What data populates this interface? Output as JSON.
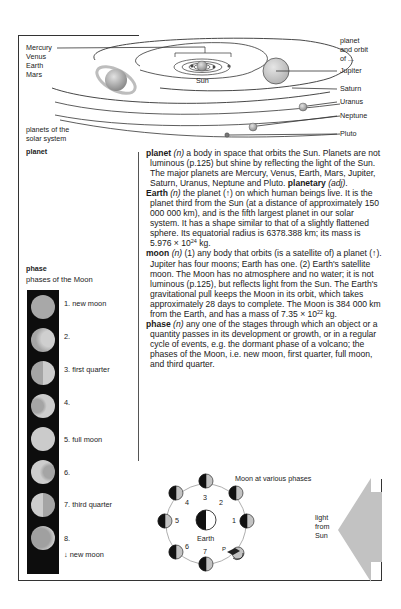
{
  "solar_diagram": {
    "inner_planets": [
      "Mercury",
      "Venus",
      "Earth",
      "Mars"
    ],
    "sun_label": "Sun",
    "caption_right": "planet and orbit of ...",
    "caption_right_lines": [
      "planet",
      "and orbit",
      "of ..."
    ],
    "outer_planets": [
      "Jupiter",
      "Saturn",
      "Uranus",
      "Neptune",
      "Pluto"
    ],
    "caption_left_lines": [
      "planets of the",
      "solar system"
    ]
  },
  "sidebar": {
    "planet_heading": "planet",
    "phase_heading": "phase",
    "phase_subheading": "phases of the Moon",
    "phases": [
      {
        "label": "1. new moon"
      },
      {
        "label": "2."
      },
      {
        "label": "3. first quarter"
      },
      {
        "label": "4."
      },
      {
        "label": "5. full moon"
      },
      {
        "label": "6."
      },
      {
        "label": "7. third quarter"
      },
      {
        "label": "8."
      }
    ],
    "cycle_note": "↓ new moon"
  },
  "entries": {
    "planet": {
      "headword": "planet",
      "pos": "(n)",
      "text": " a body in space that orbits the Sun. Planets are not luminous (p.125) but shine by reflecting the light of the Sun. The major planets are Mercury, Venus, Earth, Mars, Jupiter, Saturn, Uranus, Neptune and Pluto. ",
      "derived": "planetary",
      "derived_pos": "(adj)",
      "tail": "."
    },
    "earth": {
      "headword": "Earth",
      "pos": "(n)",
      "text": " the planet (↑) on which human beings live. It is the planet third from the Sun (at a distance of approximately 150 000 000 km), and is the fifth largest planet in our solar system. It has a shape similar to that of a slightly flattened sphere. Its equatorial radius is 6378.388 km; its mass is 5.976 × 10",
      "exp": "24",
      "tail": " kg."
    },
    "moon": {
      "headword": "moon",
      "pos": "(n)",
      "text": " (1) any body that orbits (is a satellite of) a planet (↑). Jupiter has four moons; Earth has one. (2) Earth's satellite moon. The Moon has no atmosphere and no water; it is not luminous (p.125), but reflects light from the Sun. The Earth's gravitational pull keeps the Moon in its orbit, which takes approximately 28 days to complete. The Moon is 384 000 km from the Earth, and has a mass of 7.35 × 10",
      "exp": "22",
      "tail": " kg."
    },
    "phase": {
      "headword": "phase",
      "pos": "(n)",
      "text": " any one of the stages through which an object or a quantity passes in its development or growth, or in a regular cycle of events, e.g. the dormant phase of a volcano; the phases of the Moon, i.e. new moon, first quarter, full moon, and third quarter."
    }
  },
  "moon_orbit_diagram": {
    "title": "Moon at various phases",
    "center_label": "Earth",
    "positions": [
      "1",
      "2",
      "3",
      "4",
      "5",
      "6",
      "7",
      "P"
    ],
    "light_label_lines": [
      "light",
      "from",
      "Sun"
    ]
  }
}
